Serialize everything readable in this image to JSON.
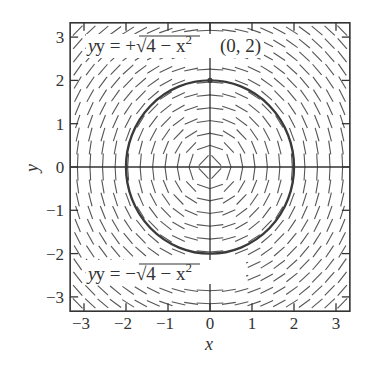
{
  "chart_data": {
    "type": "direction-field",
    "title": "",
    "xlabel": "x",
    "ylabel": "y",
    "xlim": [
      -3.33,
      3.33
    ],
    "ylim": [
      -3.33,
      3.33
    ],
    "x_ticks": [
      -3,
      -2,
      -1,
      0,
      1,
      2,
      3
    ],
    "y_ticks": [
      -3,
      -2,
      -1,
      0,
      1,
      2,
      3
    ],
    "x_tick_labels": [
      "−3",
      "−2",
      "−1",
      "0",
      "1",
      "2",
      "3"
    ],
    "y_tick_labels": [
      "−3",
      "−2",
      "−1",
      "0",
      "1",
      "2",
      "3"
    ],
    "grid": false,
    "slope_field": "dy/dx = -x/y",
    "field_grid_step": 0.3,
    "curves": [
      {
        "name": "circle",
        "equation": "x^2 + y^2 = 4",
        "radius": 2,
        "center": [
          0,
          0
        ]
      }
    ],
    "points": [
      {
        "label": "(0, 2)",
        "x": 0,
        "y": 2
      }
    ],
    "annotations": [
      {
        "text_prefix": "y = +",
        "text_radical": "√",
        "text_body": "4 − x",
        "text_sup": "2",
        "near": "upper branch"
      },
      {
        "text_prefix": "y = −",
        "text_radical": "√",
        "text_body": "4 − x",
        "text_sup": "2",
        "near": "lower branch"
      }
    ],
    "colors": {
      "axes": "#333333",
      "curve": "#3a3a3a",
      "field": "#555555"
    }
  }
}
